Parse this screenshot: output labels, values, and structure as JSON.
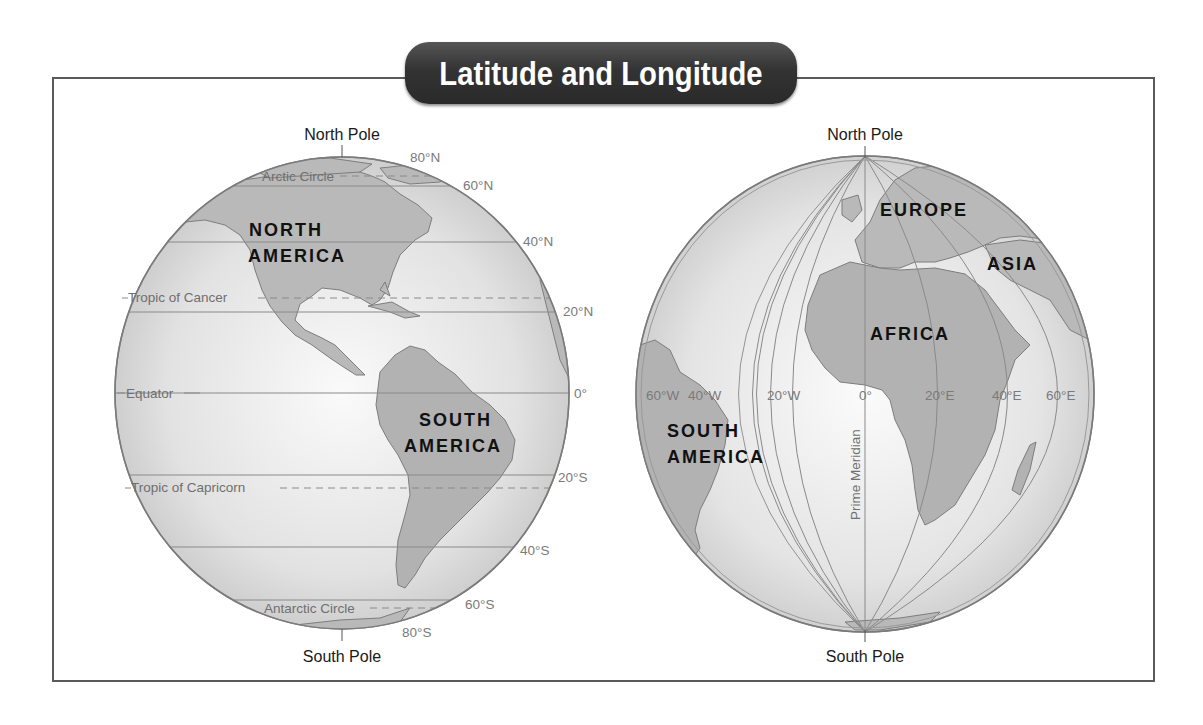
{
  "title": "Latitude and Longitude",
  "colors": {
    "frame": "#5a5a5a",
    "title_bg": "#333333",
    "title_text": "#ffffff",
    "ocean": "#e6e6e6",
    "land": "#b8b8b8",
    "grid_line": "#8a8a8a",
    "label_gray": "#7a7a7a"
  },
  "left_globe": {
    "north_pole": "North Pole",
    "south_pole": "South Pole",
    "latitudes": [
      {
        "label": "80°N"
      },
      {
        "label": "60°N"
      },
      {
        "label": "40°N"
      },
      {
        "label": "20°N"
      },
      {
        "label": "0°"
      },
      {
        "label": "20°S"
      },
      {
        "label": "40°S"
      },
      {
        "label": "60°S"
      },
      {
        "label": "80°S"
      }
    ],
    "special_lines": {
      "arctic": "Arctic Circle",
      "cancer": "Tropic of Cancer",
      "equator": "Equator",
      "capricorn": "Tropic of Capricorn",
      "antarctic": "Antarctic Circle"
    },
    "continents": {
      "north_america_1": "NORTH",
      "north_america_2": "AMERICA",
      "south_america_1": "SOUTH",
      "south_america_2": "AMERICA"
    }
  },
  "right_globe": {
    "north_pole": "North Pole",
    "south_pole": "South Pole",
    "prime_meridian": "Prime Meridian",
    "longitudes": [
      {
        "label": "60°W"
      },
      {
        "label": "40°W"
      },
      {
        "label": "20°W"
      },
      {
        "label": "0°"
      },
      {
        "label": "20°E"
      },
      {
        "label": "40°E"
      },
      {
        "label": "60°E"
      }
    ],
    "continents": {
      "europe": "EUROPE",
      "asia": "ASIA",
      "africa": "AFRICA",
      "south_america_1": "SOUTH",
      "south_america_2": "AMERICA"
    }
  }
}
